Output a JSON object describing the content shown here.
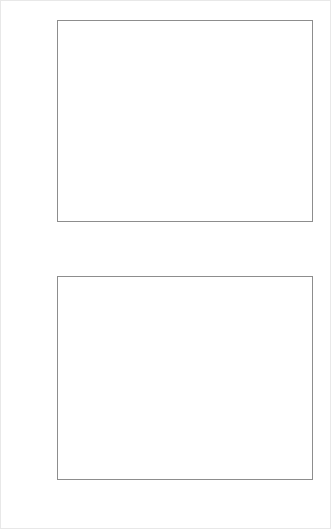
{
  "chart_data": [
    {
      "id": "asset-per-episode",
      "type": "line",
      "title": "",
      "xlabel": "episode",
      "ylabel": "asset",
      "xlim": [
        0,
        300
      ],
      "ylim": [
        3700,
        15200
      ],
      "xticks": [
        0,
        50,
        100,
        150,
        200,
        250,
        300
      ],
      "xticklabels": [
        "0",
        "50",
        "100",
        "150",
        "200",
        "250",
        "300"
      ],
      "yticks": [
        4000,
        6000,
        8000,
        10000,
        12000,
        14000
      ],
      "yticklabels": [
        "4000",
        "6000",
        "8000",
        "10000",
        "12000",
        "14000"
      ],
      "grid": false,
      "legend": null,
      "line_color": "#111111",
      "series": [
        {
          "name": "asset",
          "x": [
            0,
            1,
            2,
            3,
            4,
            5,
            6,
            7,
            8,
            9,
            10,
            11,
            12,
            13,
            14,
            15,
            16,
            17,
            18,
            19,
            20,
            21,
            22,
            23,
            24,
            25,
            26,
            27,
            28,
            29,
            30,
            31,
            32,
            33,
            34,
            35,
            36,
            37,
            38,
            39,
            40,
            41,
            42,
            43,
            44,
            45,
            46,
            47,
            48,
            49,
            50,
            51,
            52,
            53,
            54,
            55,
            56,
            57,
            58,
            59,
            60,
            61,
            62,
            63,
            64,
            65,
            66,
            67,
            68,
            69,
            70,
            71,
            72,
            73,
            74,
            75,
            76,
            77,
            78,
            79,
            80,
            81,
            82,
            83,
            84,
            85,
            86,
            87,
            88,
            89,
            90,
            91,
            92,
            93,
            94,
            95,
            96,
            97,
            98,
            99,
            100,
            101,
            102,
            103,
            104,
            105,
            106,
            107,
            108,
            109,
            110,
            111,
            112,
            113,
            114,
            115,
            116,
            117,
            118,
            119,
            120,
            121,
            122,
            123,
            124,
            125,
            126,
            127,
            128,
            129,
            130,
            131,
            132,
            133,
            134,
            135,
            136,
            137,
            138,
            139,
            140,
            141,
            142,
            143,
            144,
            145,
            146,
            147,
            148,
            149,
            150,
            151,
            152,
            153,
            154,
            155,
            156,
            157,
            158,
            159,
            160,
            161,
            162,
            163,
            164,
            165,
            166,
            167,
            168,
            169,
            170,
            171,
            172,
            173,
            174,
            175,
            176,
            177,
            178,
            179,
            180,
            181,
            182,
            183,
            184,
            185,
            186,
            187,
            188,
            189,
            190,
            191,
            192,
            193,
            194,
            195,
            196,
            197,
            198,
            199,
            200,
            201,
            202,
            203,
            204,
            205,
            206,
            207,
            208,
            209,
            210,
            211,
            212,
            213,
            214,
            215,
            216,
            217,
            218,
            219,
            220,
            221,
            222,
            223,
            224,
            225,
            226,
            227,
            228,
            229,
            230,
            231,
            232,
            233,
            234,
            235,
            236,
            237,
            238,
            239,
            240,
            241,
            242,
            243,
            244,
            245,
            246,
            247,
            248,
            249,
            250,
            251,
            252,
            253,
            254,
            255,
            256,
            257,
            258,
            259,
            260,
            261,
            262,
            263,
            264,
            265,
            266,
            267,
            268,
            269,
            270,
            271,
            272,
            273,
            274,
            275,
            276,
            277,
            278,
            279,
            280,
            281,
            282,
            283,
            284,
            285,
            286,
            287,
            288,
            289,
            290,
            291,
            292,
            293,
            294,
            295,
            296,
            297,
            298,
            299,
            300
          ],
          "values": [
            5750,
            5700,
            5500,
            5300,
            5600,
            5500,
            5750,
            5550,
            5450,
            5700,
            5600,
            5400,
            5650,
            5500,
            5350,
            5600,
            5700,
            5500,
            5400,
            5600,
            5500,
            5350,
            5150,
            4950,
            4300,
            4450,
            4700,
            4400,
            5100,
            5300,
            5200,
            5450,
            5350,
            5550,
            5400,
            5250,
            5500,
            5750,
            5600,
            5400,
            5650,
            5500,
            5900,
            5700,
            5450,
            5650,
            5850,
            6250,
            5950,
            5650,
            5850,
            5600,
            5400,
            5600,
            5800,
            5500,
            5300,
            5550,
            5700,
            5500,
            5250,
            5500,
            5700,
            5450,
            5250,
            5500,
            5650,
            5400,
            5200,
            5450,
            5700,
            5500,
            5300,
            5550,
            5750,
            5900,
            5650,
            5400,
            5200,
            4800,
            5000,
            5250,
            5500,
            5700,
            5450,
            5250,
            5500,
            5750,
            6050,
            5800,
            5500,
            5250,
            5500,
            5750,
            5500,
            5300,
            5550,
            5800,
            6150,
            5900,
            5600,
            5350,
            5100,
            4800,
            4550,
            5000,
            5400,
            5700,
            5500,
            5800,
            6100,
            5900,
            5650,
            6000,
            6250,
            6000,
            5800,
            6100,
            6400,
            6200,
            6600,
            6300,
            6100,
            6450,
            6700,
            6400,
            6200,
            6500,
            6900,
            6600,
            6350,
            6700,
            7100,
            7550,
            7200,
            6900,
            7250,
            7600,
            7300,
            7000,
            6650,
            6300,
            5900,
            6300,
            6700,
            7000,
            7300,
            7000,
            6750,
            7050,
            7400,
            7700,
            7500,
            7250,
            7600,
            7900,
            8200,
            8000,
            8300,
            7900,
            7600,
            7900,
            8200,
            7900,
            8200,
            8500,
            8900,
            8600,
            9100,
            8800,
            9200,
            9600,
            9300,
            9700,
            10200,
            9800,
            9400,
            9900,
            10300,
            9900,
            9500,
            9900,
            10400,
            10000,
            9600,
            10100,
            10600,
            10200,
            9800,
            10300,
            10800,
            10400,
            10000,
            9700,
            10200,
            10700,
            11200,
            10800,
            10400,
            10900,
            11400,
            11000,
            10600,
            9800,
            7000,
            8100,
            8600,
            9100,
            9500,
            10000,
            10500,
            11000,
            11500,
            12000,
            11700,
            12400,
            12900,
            13400,
            12800,
            13700,
            13100,
            12400,
            11700,
            12100,
            12600,
            13000,
            12500,
            12000,
            11400,
            12000,
            12500,
            12100,
            11600,
            12200,
            12800,
            13300,
            13900,
            14400,
            14900,
            14300,
            13600,
            12900,
            12200,
            11500,
            11000,
            11500,
            12100,
            11700,
            12200,
            11800,
            11300,
            10800,
            11500,
            12100,
            11600,
            12200,
            12900,
            13400,
            14000,
            14500,
            14900,
            14300,
            13600,
            13000,
            12400,
            11800,
            11200,
            11700,
            12300,
            12800,
            13400,
            12900,
            12300,
            11700,
            11200,
            10600,
            9000,
            8600,
            9500,
            10200,
            10900,
            11700,
            12500,
            13200,
            13800,
            14300,
            14900,
            14200,
            13500,
            12800,
            12100,
            11400,
            9500,
            8500,
            7200,
            5100,
            6500,
            8000,
            9500,
            11000,
            12000,
            12700,
            13300,
            12600,
            12000,
            12700,
            13400,
            12800,
            13400,
            14000,
            14300
          ]
        }
      ]
    },
    {
      "id": "average-asset",
      "type": "line",
      "title": "",
      "xlabel": "t",
      "ylabel": "average asset",
      "xlim": [
        0,
        1000
      ],
      "ylim": [
        0,
        57000
      ],
      "xticks": [
        0,
        200,
        400,
        600,
        800,
        1000
      ],
      "xticklabels": [
        "0",
        "200",
        "400",
        "600",
        "800",
        "1000"
      ],
      "yticks": [
        0,
        10000,
        20000,
        30000,
        40000,
        50000
      ],
      "yticklabels": [
        "0",
        "10000",
        "20000",
        "30000",
        "40000",
        "50000"
      ],
      "grid": false,
      "legend": null,
      "line_color": "#111111",
      "annotations": [
        {
          "type": "vline",
          "x": 300,
          "style": "dashed",
          "color": "#111111"
        }
      ],
      "series": [
        {
          "name": "average asset",
          "x": [
            0,
            20,
            40,
            60,
            80,
            100,
            120,
            140,
            160,
            180,
            200,
            220,
            240,
            260,
            280,
            300,
            320,
            340,
            360,
            380,
            400,
            420,
            440,
            460,
            480,
            500,
            520,
            540,
            560,
            580,
            600,
            620,
            640,
            660,
            680,
            700,
            720,
            740,
            760,
            780,
            800,
            820,
            840,
            860,
            880,
            900,
            920,
            940,
            960,
            980,
            1000
          ],
          "values": [
            5000,
            5050,
            5150,
            5600,
            6000,
            6500,
            6900,
            7500,
            8000,
            8800,
            9500,
            10400,
            11200,
            12300,
            13600,
            15200,
            16000,
            17200,
            18200,
            19500,
            20500,
            21800,
            23000,
            24500,
            26000,
            27500,
            29000,
            31000,
            32500,
            34500,
            36000,
            37800,
            39500,
            41000,
            42500,
            43800,
            44800,
            45800,
            46500,
            47200,
            48000,
            48800,
            49500,
            50200,
            51000,
            51800,
            52500,
            53200,
            53800,
            54500,
            54300
          ]
        }
      ]
    }
  ]
}
